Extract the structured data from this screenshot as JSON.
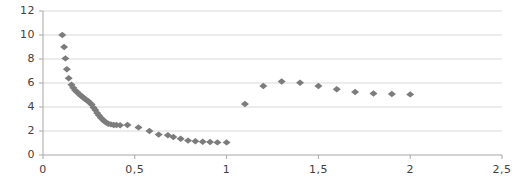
{
  "chart_data": {
    "type": "scatter",
    "title": "",
    "xlabel": "",
    "ylabel": "",
    "xlim": [
      0,
      2.5
    ],
    "ylim": [
      0,
      12
    ],
    "grid": true,
    "grid_axis": "y",
    "legend": "none",
    "marker": "diamond",
    "marker_color": "#7c7c7c",
    "decimal_separator": ",",
    "x_ticks": [
      0,
      0.5,
      1,
      1.5,
      2,
      2.5
    ],
    "x_tick_labels": [
      "0",
      "0,5",
      "1",
      "1,5",
      "2",
      "2,5"
    ],
    "y_ticks": [
      0,
      2,
      4,
      6,
      8,
      10,
      12
    ],
    "y_tick_labels": [
      "0",
      "2",
      "4",
      "6",
      "8",
      "10",
      "12"
    ],
    "series": [
      {
        "name": "branch-1",
        "points": [
          [
            0.105,
            10.0
          ],
          [
            0.115,
            9.0
          ],
          [
            0.122,
            8.05
          ],
          [
            0.13,
            7.15
          ],
          [
            0.14,
            6.4
          ],
          [
            0.155,
            5.85
          ],
          [
            0.165,
            5.6
          ],
          [
            0.175,
            5.4
          ],
          [
            0.185,
            5.25
          ],
          [
            0.195,
            5.1
          ],
          [
            0.205,
            4.95
          ],
          [
            0.215,
            4.85
          ],
          [
            0.225,
            4.7
          ],
          [
            0.235,
            4.6
          ],
          [
            0.245,
            4.5
          ],
          [
            0.255,
            4.35
          ],
          [
            0.265,
            4.2
          ],
          [
            0.275,
            3.95
          ],
          [
            0.285,
            3.75
          ],
          [
            0.295,
            3.5
          ],
          [
            0.305,
            3.3
          ],
          [
            0.315,
            3.1
          ],
          [
            0.325,
            2.95
          ],
          [
            0.335,
            2.8
          ],
          [
            0.345,
            2.7
          ],
          [
            0.355,
            2.6
          ],
          [
            0.37,
            2.55
          ],
          [
            0.385,
            2.5
          ],
          [
            0.4,
            2.5
          ],
          [
            0.42,
            2.48
          ],
          [
            0.46,
            2.5
          ],
          [
            0.52,
            2.3
          ],
          [
            0.58,
            2.0
          ],
          [
            0.63,
            1.7
          ],
          [
            0.68,
            1.65
          ],
          [
            0.71,
            1.5
          ],
          [
            0.75,
            1.35
          ],
          [
            0.79,
            1.2
          ],
          [
            0.83,
            1.15
          ],
          [
            0.87,
            1.1
          ],
          [
            0.91,
            1.08
          ],
          [
            0.95,
            1.05
          ],
          [
            1.0,
            1.05
          ]
        ]
      },
      {
        "name": "branch-2",
        "points": [
          [
            1.1,
            4.25
          ],
          [
            1.2,
            5.75
          ],
          [
            1.3,
            6.12
          ],
          [
            1.4,
            6.02
          ],
          [
            1.5,
            5.75
          ],
          [
            1.6,
            5.48
          ],
          [
            1.7,
            5.25
          ],
          [
            1.8,
            5.12
          ],
          [
            1.9,
            5.08
          ],
          [
            2.0,
            5.05
          ]
        ]
      }
    ]
  },
  "style": {
    "axis_color": "#a6a6a6",
    "grid_color": "#d9d9d9",
    "tick_text_color": "#404040",
    "background": "#ffffff"
  }
}
